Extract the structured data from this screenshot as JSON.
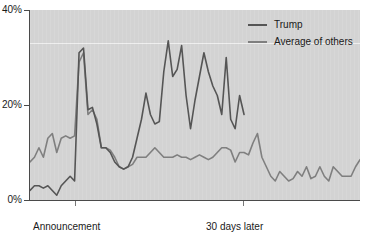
{
  "chart_data": {
    "type": "line",
    "title": "",
    "subtitle": "",
    "xlabel": "",
    "ylabel": "",
    "ylim": [
      0,
      40
    ],
    "ytick_labels": [
      "0%",
      "20%",
      "40%"
    ],
    "ytick_values": [
      0,
      20,
      40
    ],
    "xtick_labels": [
      "Announcement\nof candidacy",
      "30 days later"
    ],
    "xtick_values": [
      8,
      38
    ],
    "xlim": [
      0,
      74
    ],
    "grid": "single faint white horizontal line at 33%",
    "gridline_values": [
      33
    ],
    "legend_position": "top-right",
    "legend": [
      "Trump",
      "Average of others"
    ],
    "series": [
      {
        "name": "Trump",
        "color": "#555555",
        "x": [
          0,
          1,
          2,
          3,
          4,
          5,
          6,
          7,
          8,
          9,
          10,
          11,
          12,
          13,
          14,
          15,
          16,
          17,
          18,
          19,
          20,
          21,
          22,
          23,
          24,
          25,
          26,
          27,
          28,
          29,
          30,
          31,
          32,
          33,
          34,
          35,
          36,
          37,
          38,
          39,
          40,
          41,
          42,
          43,
          44,
          45,
          46,
          47,
          48
        ],
        "values": [
          2,
          3,
          3,
          2.5,
          3,
          2,
          1,
          3,
          4,
          5,
          4,
          31,
          32,
          19,
          19.5,
          16,
          11,
          11,
          10,
          8,
          7,
          6.5,
          7,
          9,
          13,
          17,
          22.5,
          18,
          16,
          16.5,
          27,
          33.5,
          26,
          27.5,
          32.5,
          22,
          15,
          21,
          26,
          31,
          27,
          24,
          22,
          18,
          30,
          17,
          15,
          22,
          18
        ]
      },
      {
        "name": "Average of others",
        "color": "#7f7f7f",
        "x": [
          0,
          1,
          2,
          3,
          4,
          5,
          6,
          7,
          8,
          9,
          10,
          11,
          12,
          13,
          14,
          15,
          16,
          17,
          18,
          19,
          20,
          21,
          22,
          23,
          24,
          25,
          26,
          27,
          28,
          29,
          30,
          31,
          32,
          33,
          34,
          35,
          36,
          37,
          38,
          39,
          40,
          41,
          42,
          43,
          44,
          45,
          46,
          47,
          48,
          49,
          50,
          51,
          52,
          53,
          54,
          55,
          56,
          57,
          58,
          59,
          60,
          61,
          62,
          63,
          64,
          65,
          66,
          67,
          68,
          69,
          70,
          71,
          72,
          73,
          74
        ],
        "values": [
          8,
          9,
          11,
          9,
          13,
          14,
          10,
          13,
          13.5,
          13,
          13.5,
          29,
          31,
          18,
          19,
          17,
          11,
          11,
          10.5,
          9,
          7,
          6.5,
          7,
          7.5,
          9,
          9,
          9,
          10,
          11,
          10,
          9,
          9,
          9,
          9.5,
          9,
          9,
          8.5,
          9,
          9.5,
          9,
          8.5,
          9,
          10,
          11,
          11,
          10.5,
          8,
          10,
          10,
          9.5,
          12,
          14,
          9,
          7,
          5,
          4,
          6,
          5,
          4,
          4.5,
          6,
          5,
          7,
          4.5,
          5,
          7,
          5,
          4,
          7,
          6,
          5,
          5,
          5,
          7,
          8.5
        ]
      }
    ]
  },
  "axis": {
    "y_ticks": [
      {
        "label": "40%",
        "value": 40
      },
      {
        "label": "20%",
        "value": 20
      },
      {
        "label": "0%",
        "value": 0
      }
    ],
    "x_ticks": [
      {
        "label_line1": "Announcement",
        "label_line2": "of candidacy",
        "value": 8
      },
      {
        "label_line1": "30 days later",
        "label_line2": "",
        "value": 38
      }
    ]
  },
  "legend": {
    "items": [
      {
        "label": "Trump",
        "color": "#555555"
      },
      {
        "label": "Average of others",
        "color": "#7f7f7f"
      }
    ]
  },
  "colors": {
    "plot_background": "#d3d3d3",
    "axis": "#4a4a4a",
    "text": "#1a1a1a",
    "gridline": "#ffffff"
  }
}
